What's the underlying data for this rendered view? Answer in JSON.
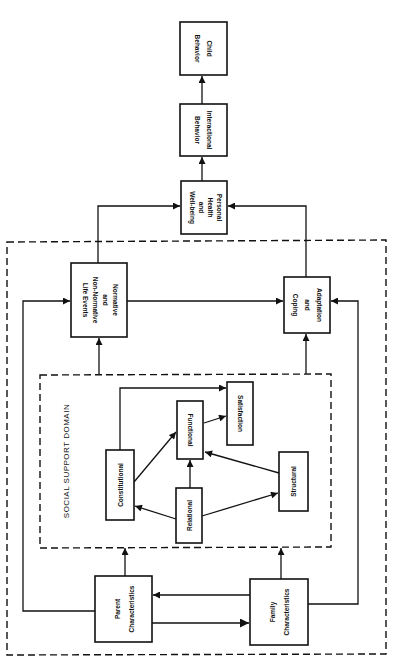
{
  "diagram": {
    "nodes": {
      "child_behavior": {
        "line1": "Child",
        "line2": "Behavior"
      },
      "interactional_behavior": {
        "line1": "Interactional",
        "line2": "Behavior"
      },
      "personal_health": {
        "line1": "Personal",
        "line2": "Health",
        "line3": "and",
        "line4": "Well-being"
      },
      "normative_events": {
        "line1": "Normative",
        "line2": "and",
        "line3": "Non-Normative",
        "line4": "Life Events"
      },
      "adaptation_coping": {
        "line1": "Adaptation",
        "line2": "and",
        "line3": "Coping"
      },
      "satisfaction": {
        "line1": "Satisfaction"
      },
      "functional": {
        "line1": "Functional"
      },
      "constitutional": {
        "line1": "Constitutional"
      },
      "relational": {
        "line1": "Relational"
      },
      "structural": {
        "line1": "Structural"
      },
      "parent_characteristics": {
        "line1": "Parent",
        "line2": "Characteristics"
      },
      "family_characteristics": {
        "line1": "Family",
        "line2": "Characteristics"
      }
    },
    "groups": {
      "social_support_domain": {
        "label": "SOCIAL SUPPORT DOMAIN"
      }
    },
    "edges": [
      {
        "from": "Interactional Behavior",
        "to": "Child Behavior"
      },
      {
        "from": "Personal Health and Well-being",
        "to": "Interactional Behavior"
      },
      {
        "from": "Normative and Non-Normative Life Events",
        "to": "Personal Health and Well-being"
      },
      {
        "from": "Adaptation and Coping",
        "to": "Personal Health and Well-being"
      },
      {
        "from": "Normative and Non-Normative Life Events",
        "to": "Adaptation and Coping"
      },
      {
        "from": "Social Support Domain",
        "to": "Normative and Non-Normative Life Events"
      },
      {
        "from": "Social Support Domain",
        "to": "Adaptation and Coping"
      },
      {
        "from": "Constitutional",
        "to": "Satisfaction"
      },
      {
        "from": "Constitutional",
        "to": "Functional"
      },
      {
        "from": "Functional",
        "to": "Satisfaction"
      },
      {
        "from": "Relational",
        "to": "Functional"
      },
      {
        "from": "Relational",
        "to": "Constitutional"
      },
      {
        "from": "Relational",
        "to": "Structural"
      },
      {
        "from": "Structural",
        "to": "Functional"
      },
      {
        "from": "Parent Characteristics",
        "to": "Social Support Domain"
      },
      {
        "from": "Family Characteristics",
        "to": "Social Support Domain"
      },
      {
        "from": "Parent Characteristics",
        "to": "Family Characteristics"
      },
      {
        "from": "Family Characteristics",
        "to": "Parent Characteristics"
      },
      {
        "from": "Parent Characteristics",
        "to": "Normative and Non-Normative Life Events"
      },
      {
        "from": "Family Characteristics",
        "to": "Adaptation and Coping"
      }
    ]
  }
}
